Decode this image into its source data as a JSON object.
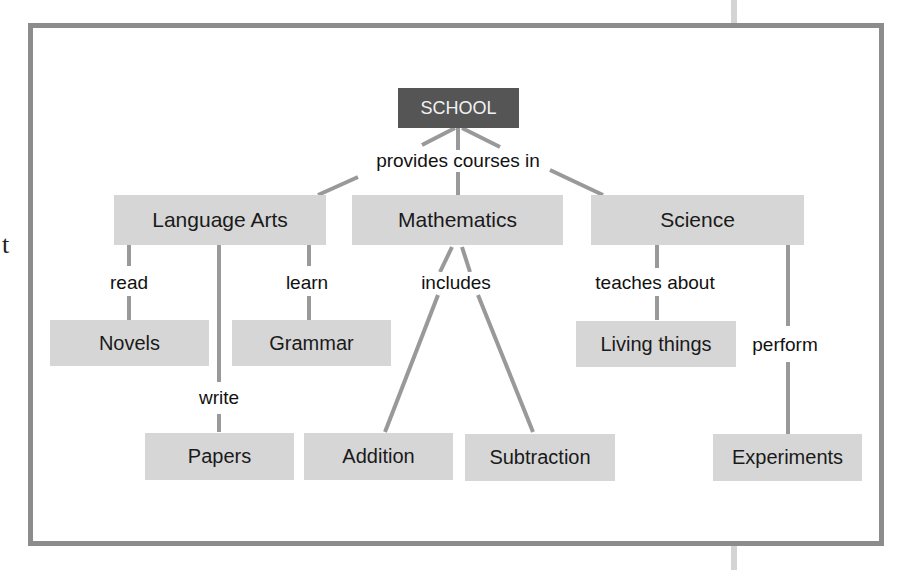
{
  "stray_text": "t",
  "colors": {
    "frame": "#8c8c8c",
    "node_fill": "#d6d6d6",
    "root_fill": "#555555",
    "link": "#999999"
  },
  "nodes": {
    "school": "SCHOOL",
    "language_arts": "Language Arts",
    "mathematics": "Mathematics",
    "science": "Science",
    "novels": "Novels",
    "grammar": "Grammar",
    "papers": "Papers",
    "addition": "Addition",
    "subtraction": "Subtraction",
    "living_things": "Living things",
    "experiments": "Experiments"
  },
  "links": {
    "provides_courses_in": "provides courses in",
    "read": "read",
    "learn": "learn",
    "write": "write",
    "includes": "includes",
    "teaches_about": "teaches about",
    "perform": "perform"
  }
}
